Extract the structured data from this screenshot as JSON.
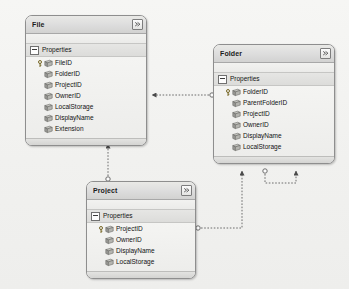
{
  "diagram": {
    "background_color": "#f2f2f0",
    "entity_border_color": "#8e8e8e",
    "header_color": "#dedede",
    "connector_color": "#6d6d6d",
    "connector_style": "dotted",
    "section_label": "Properties",
    "collapse_icon": "collapse-chevrons-icon",
    "key_icon": "primary-key-icon",
    "property_icon": "scalar-property-icon"
  },
  "entities": [
    {
      "name": "File",
      "section": "Properties",
      "properties": [
        {
          "name": "FileID",
          "key": true
        },
        {
          "name": "FolderID",
          "key": false
        },
        {
          "name": "ProjectID",
          "key": false
        },
        {
          "name": "OwnerID",
          "key": false
        },
        {
          "name": "LocalStorage",
          "key": false
        },
        {
          "name": "DisplayName",
          "key": false
        },
        {
          "name": "Extension",
          "key": false
        }
      ]
    },
    {
      "name": "Folder",
      "section": "Properties",
      "properties": [
        {
          "name": "FolderID",
          "key": true
        },
        {
          "name": "ParentFolderID",
          "key": false
        },
        {
          "name": "ProjectID",
          "key": false
        },
        {
          "name": "OwnerID",
          "key": false
        },
        {
          "name": "DisplayName",
          "key": false
        },
        {
          "name": "LocalStorage",
          "key": false
        }
      ]
    },
    {
      "name": "Project",
      "section": "Properties",
      "properties": [
        {
          "name": "ProjectID",
          "key": true
        },
        {
          "name": "OwnerID",
          "key": false
        },
        {
          "name": "DisplayName",
          "key": false
        },
        {
          "name": "LocalStorage",
          "key": false
        }
      ]
    }
  ],
  "associations": [
    {
      "from": "Folder",
      "to": "File",
      "name": "folder-to-file-association"
    },
    {
      "from": "Project",
      "to": "File",
      "name": "project-to-file-association"
    },
    {
      "from": "Project",
      "to": "Folder",
      "name": "project-to-folder-association"
    },
    {
      "from": "Folder",
      "to": "Folder",
      "name": "folder-self-association"
    }
  ]
}
